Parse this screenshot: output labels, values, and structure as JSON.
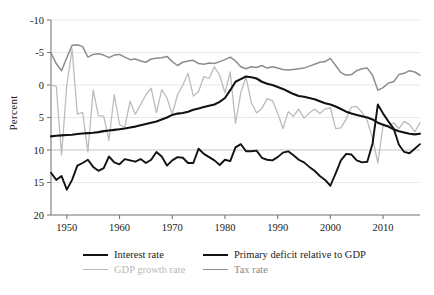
{
  "chart_data": {
    "type": "line",
    "title": "",
    "xlabel": "",
    "ylabel": "Percent",
    "xlim": [
      1947,
      2017
    ],
    "ylim": [
      -10,
      20
    ],
    "xticks": [
      1950,
      1960,
      1970,
      1980,
      1990,
      2000,
      2010
    ],
    "yticks": [
      -10,
      -5,
      0,
      5,
      10,
      15,
      20
    ],
    "grid": "horizontal",
    "legend_position": "below-axes",
    "colors": {
      "interest_rate": "#121212",
      "gdp_growth_rate": "#bcbcbc",
      "primary_deficit": "#121212",
      "tax_rate": "#8d8d8d",
      "gridline": "#e8e8e8",
      "axis": "#7a7a7a"
    },
    "series": [
      {
        "name": "Interest rate",
        "color": "#121212",
        "width": 2.1,
        "x": [
          1947,
          1948,
          1949,
          1950,
          1951,
          1952,
          1953,
          1954,
          1955,
          1956,
          1957,
          1958,
          1959,
          1960,
          1961,
          1962,
          1963,
          1964,
          1965,
          1966,
          1967,
          1968,
          1969,
          1970,
          1971,
          1972,
          1973,
          1974,
          1975,
          1976,
          1977,
          1978,
          1979,
          1980,
          1981,
          1982,
          1983,
          1984,
          1985,
          1986,
          1987,
          1988,
          1989,
          1990,
          1991,
          1992,
          1993,
          1994,
          1995,
          1996,
          1997,
          1998,
          1999,
          2000,
          2001,
          2002,
          2003,
          2004,
          2005,
          2006,
          2007,
          2008,
          2009,
          2010,
          2011,
          2012,
          2013,
          2014,
          2015,
          2016,
          2017
        ],
        "y": [
          2.1,
          2.2,
          2.25,
          2.3,
          2.35,
          2.45,
          2.55,
          2.6,
          2.65,
          2.75,
          2.9,
          3.0,
          3.1,
          3.2,
          3.3,
          3.45,
          3.6,
          3.8,
          4.0,
          4.2,
          4.4,
          4.7,
          5.0,
          5.4,
          5.6,
          5.7,
          5.9,
          6.2,
          6.4,
          6.6,
          6.8,
          7.0,
          7.4,
          8.0,
          9.2,
          10.5,
          10.9,
          11.3,
          11.2,
          11.0,
          10.5,
          10.2,
          10.0,
          9.7,
          9.4,
          9.0,
          8.6,
          8.3,
          8.2,
          8.0,
          7.8,
          7.5,
          7.2,
          7.0,
          6.7,
          6.3,
          5.9,
          5.6,
          5.4,
          5.2,
          5.0,
          4.7,
          4.2,
          3.9,
          3.6,
          3.2,
          2.9,
          2.7,
          2.5,
          2.4,
          2.5
        ]
      },
      {
        "name": "GDP growth rate",
        "color": "#bcbcbc",
        "width": 1.3,
        "x": [
          1947,
          1948,
          1949,
          1950,
          1951,
          1952,
          1953,
          1954,
          1955,
          1956,
          1957,
          1958,
          1959,
          1960,
          1961,
          1962,
          1963,
          1964,
          1965,
          1966,
          1967,
          1968,
          1969,
          1970,
          1971,
          1972,
          1973,
          1974,
          1975,
          1976,
          1977,
          1978,
          1979,
          1980,
          1981,
          1982,
          1983,
          1984,
          1985,
          1986,
          1987,
          1988,
          1989,
          1990,
          1991,
          1992,
          1993,
          1994,
          1995,
          1996,
          1997,
          1998,
          1999,
          2000,
          2001,
          2002,
          2003,
          2004,
          2005,
          2006,
          2007,
          2008,
          2009,
          2010,
          2011,
          2012,
          2013,
          2014,
          2015,
          2016,
          2017
        ],
        "y": [
          10.0,
          9.8,
          -0.8,
          10.0,
          15.5,
          5.5,
          5.8,
          -0.3,
          9.2,
          5.3,
          5.2,
          1.5,
          8.5,
          3.9,
          3.5,
          7.5,
          5.5,
          7.0,
          8.5,
          9.5,
          5.7,
          9.3,
          8.0,
          5.5,
          8.5,
          10.0,
          11.8,
          8.3,
          9.0,
          11.3,
          11.0,
          12.8,
          11.5,
          8.8,
          12.0,
          4.1,
          8.8,
          11.2,
          7.3,
          5.7,
          6.4,
          7.9,
          7.6,
          5.7,
          3.3,
          5.9,
          5.2,
          6.3,
          4.9,
          5.7,
          6.3,
          5.6,
          6.3,
          6.5,
          3.3,
          3.4,
          4.8,
          6.6,
          6.7,
          5.8,
          4.5,
          1.8,
          -2.0,
          3.8,
          3.7,
          4.2,
          3.3,
          4.4,
          3.9,
          2.8,
          4.2
        ]
      },
      {
        "name": "Primary deficit relative to GDP",
        "color": "#121212",
        "width": 1.9,
        "x": [
          1947,
          1948,
          1949,
          1950,
          1951,
          1952,
          1953,
          1954,
          1955,
          1956,
          1957,
          1958,
          1959,
          1960,
          1961,
          1962,
          1963,
          1964,
          1965,
          1966,
          1967,
          1968,
          1969,
          1970,
          1971,
          1972,
          1973,
          1974,
          1975,
          1976,
          1977,
          1978,
          1979,
          1980,
          1981,
          1982,
          1983,
          1984,
          1985,
          1986,
          1987,
          1988,
          1989,
          1990,
          1991,
          1992,
          1993,
          1994,
          1995,
          1996,
          1997,
          1998,
          1999,
          2000,
          2001,
          2002,
          2003,
          2004,
          2005,
          2006,
          2007,
          2008,
          2009,
          2010,
          2011,
          2012,
          2013,
          2014,
          2015,
          2016,
          2017
        ],
        "y": [
          -3.5,
          -4.6,
          -4.0,
          -6.1,
          -4.6,
          -2.4,
          -2.0,
          -1.5,
          -2.6,
          -3.2,
          -2.8,
          -1.0,
          -1.9,
          -2.2,
          -1.4,
          -1.6,
          -1.8,
          -1.4,
          -2.0,
          -1.5,
          -0.3,
          -1.0,
          -2.4,
          -1.6,
          -1.1,
          -1.2,
          -2.0,
          -2.0,
          0.2,
          -0.6,
          -1.1,
          -1.6,
          -2.3,
          -1.5,
          -1.7,
          0.4,
          0.9,
          -0.2,
          -0.2,
          -0.1,
          -1.2,
          -1.5,
          -1.6,
          -1.1,
          -0.4,
          -0.2,
          -0.8,
          -1.5,
          -1.9,
          -2.6,
          -3.2,
          -4.0,
          -4.6,
          -5.5,
          -3.6,
          -1.6,
          -0.6,
          -0.7,
          -1.6,
          -1.9,
          -1.8,
          1.0,
          7.0,
          5.6,
          4.4,
          3.3,
          0.8,
          -0.3,
          -0.5,
          0.2,
          0.9
        ]
      },
      {
        "name": "Tax rate",
        "color": "#8d8d8d",
        "width": 1.5,
        "x": [
          1947,
          1948,
          1949,
          1950,
          1951,
          1952,
          1953,
          1954,
          1955,
          1956,
          1957,
          1958,
          1959,
          1960,
          1961,
          1962,
          1963,
          1964,
          1965,
          1966,
          1967,
          1968,
          1969,
          1970,
          1971,
          1972,
          1973,
          1974,
          1975,
          1976,
          1977,
          1978,
          1979,
          1980,
          1981,
          1982,
          1983,
          1984,
          1985,
          1986,
          1987,
          1988,
          1989,
          1990,
          1991,
          1992,
          1993,
          1994,
          1995,
          1996,
          1997,
          1998,
          1999,
          2000,
          2001,
          2002,
          2003,
          2004,
          2005,
          2006,
          2007,
          2008,
          2009,
          2010,
          2011,
          2012,
          2013,
          2014,
          2015,
          2016,
          2017
        ],
        "y": [
          14.9,
          13.3,
          12.2,
          14.2,
          16.1,
          16.2,
          15.9,
          14.3,
          14.7,
          14.8,
          14.6,
          14.2,
          14.6,
          14.7,
          14.3,
          13.9,
          14.0,
          13.7,
          13.5,
          14.0,
          14.1,
          14.2,
          14.4,
          13.6,
          13.0,
          13.5,
          13.7,
          13.8,
          13.3,
          13.2,
          13.4,
          13.3,
          13.6,
          13.9,
          14.3,
          13.7,
          12.8,
          12.5,
          12.8,
          12.7,
          13.0,
          12.6,
          12.8,
          12.6,
          12.4,
          12.3,
          12.4,
          12.5,
          12.6,
          12.9,
          13.2,
          13.5,
          13.6,
          14.1,
          13.0,
          11.9,
          11.5,
          11.6,
          12.2,
          12.5,
          12.6,
          11.5,
          9.2,
          9.6,
          10.3,
          10.5,
          11.6,
          11.8,
          12.2,
          12.0,
          11.5
        ]
      }
    ]
  },
  "axes": {
    "ylabel_text": "Percent",
    "ytick_labels": [
      "20",
      "15",
      "10",
      "5",
      "0",
      "-5",
      "-10"
    ],
    "xtick_labels": [
      "1950",
      "1960",
      "1970",
      "1980",
      "1990",
      "2000",
      "2010"
    ]
  },
  "legend": {
    "items": [
      {
        "label": "Interest rate",
        "style": "thick-dark"
      },
      {
        "label": "Primary deficit relative to GDP",
        "style": "thick-dark"
      },
      {
        "label": "GDP growth rate",
        "style": "thin-light"
      },
      {
        "label": "Tax rate",
        "style": "thin-mid"
      }
    ]
  }
}
